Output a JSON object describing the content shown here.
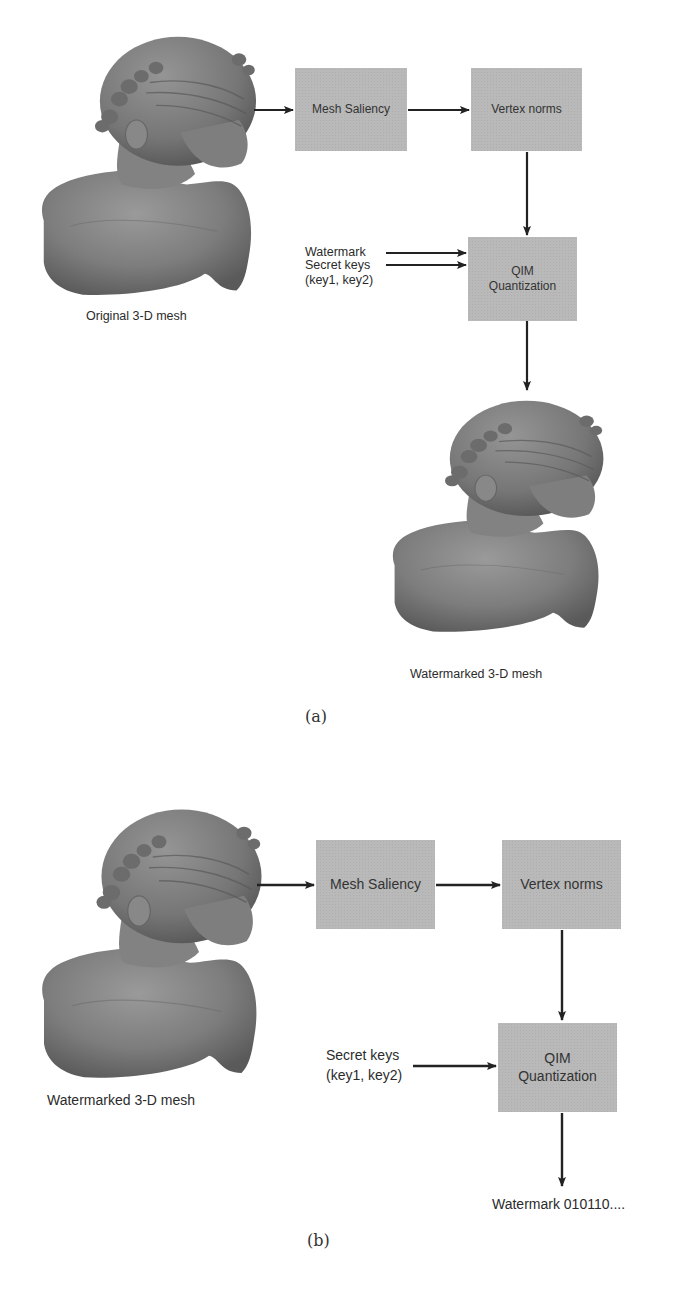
{
  "figure_a": {
    "caption": "(a)",
    "input_label": "Original 3-D mesh",
    "output_label": "Watermarked 3-D mesh",
    "boxes": {
      "mesh_saliency": "Mesh Saliency",
      "vertex_norms": "Vertex norms",
      "qim_line1": "QIM",
      "qim_line2": "Quantization"
    },
    "inputs": {
      "watermark": "Watermark",
      "secret_keys_line1": "Secret keys",
      "secret_keys_line2": "(key1, key2)"
    }
  },
  "figure_b": {
    "caption": "(b)",
    "input_label": "Watermarked 3-D mesh",
    "output_label": "Watermark 010110....",
    "boxes": {
      "mesh_saliency": "Mesh Saliency",
      "vertex_norms": "Vertex norms",
      "qim_line1": "QIM",
      "qim_line2": "Quantization"
    },
    "inputs": {
      "secret_keys_line1": "Secret keys",
      "secret_keys_line2": "(key1, key2)"
    }
  },
  "colors": {
    "box_fill": "#b9b9b9",
    "arrow": "#222222",
    "mesh_gray": "#7a7a7a"
  }
}
